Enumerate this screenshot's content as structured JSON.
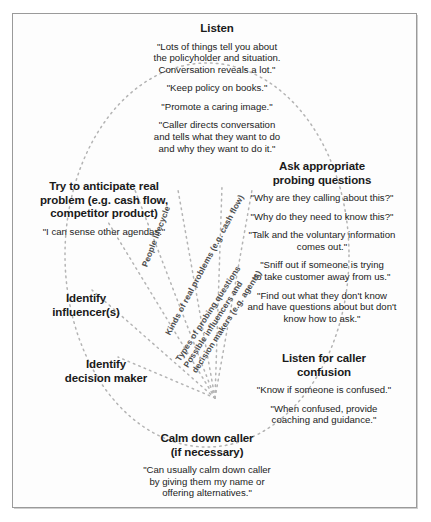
{
  "diagram": {
    "type": "radial-cognitive-map",
    "title_node": "Listen",
    "frame_color": "#9a9a9a",
    "line_color": "#b4b4b4",
    "text_color": "#1a1a1a",
    "center": {
      "x": 215,
      "y": 398
    }
  },
  "nodes": [
    {
      "id": "listen",
      "heading": "Listen",
      "quotes": [
        "\"Lots of things tell you about\nthe policyholder and situation.\nConversation reveals a lot.\"",
        "\"Keep policy on books.\"",
        "\"Promote a caring image.\"",
        "\"Caller directs conversation\nand tells what they want to do\nand why they want to do it.\""
      ]
    },
    {
      "id": "ask-probing-questions",
      "heading": "Ask appropriate\nprobing questions",
      "quotes": [
        "\"Why are they calling about this?\"",
        "\"Why do they need to know this?\"",
        "\"Talk and the voluntary information\ncomes out.\"",
        "\"Sniff out if someone is trying\nto take customer away from us.\"",
        "\"Find out what they don't know\nand have questions about but don't\nknow how to ask.\""
      ]
    },
    {
      "id": "listen-for-caller-confusion",
      "heading": "Listen for caller\nconfusion",
      "quotes": [
        "\"Know if someone is confused.\"",
        "\"When confused, provide\ncoaching and guidance.\""
      ]
    },
    {
      "id": "calm-down-caller",
      "heading": "Calm down caller\n(if necessary)",
      "quotes": [
        "\"Can usually calm down caller\nby giving them my name or\noffering alternatives.\""
      ]
    },
    {
      "id": "identify-decision-maker",
      "heading": "Identify\ndecision maker",
      "quotes": []
    },
    {
      "id": "identify-influencers",
      "heading": "Identify\ninfluencer(s)",
      "quotes": []
    },
    {
      "id": "anticipate-real-problem",
      "heading": "Try to anticipate real\nproblem (e.g. cash flow,\ncompetitor product)",
      "quotes": [
        "\"I can sense other agendas.\""
      ]
    }
  ],
  "spokes": [
    {
      "id": "people-lifecycle",
      "label": "People lifecycle"
    },
    {
      "id": "kinds-of-real-problems",
      "label": "Kinds of real problems (e.g. cash flow)"
    },
    {
      "id": "types-of-probing-questions",
      "label": "Types of probing questions"
    },
    {
      "id": "possible-influencers-decision-makers",
      "label": "Possible influencers and\ndecision makers (e.g. agents)"
    }
  ]
}
